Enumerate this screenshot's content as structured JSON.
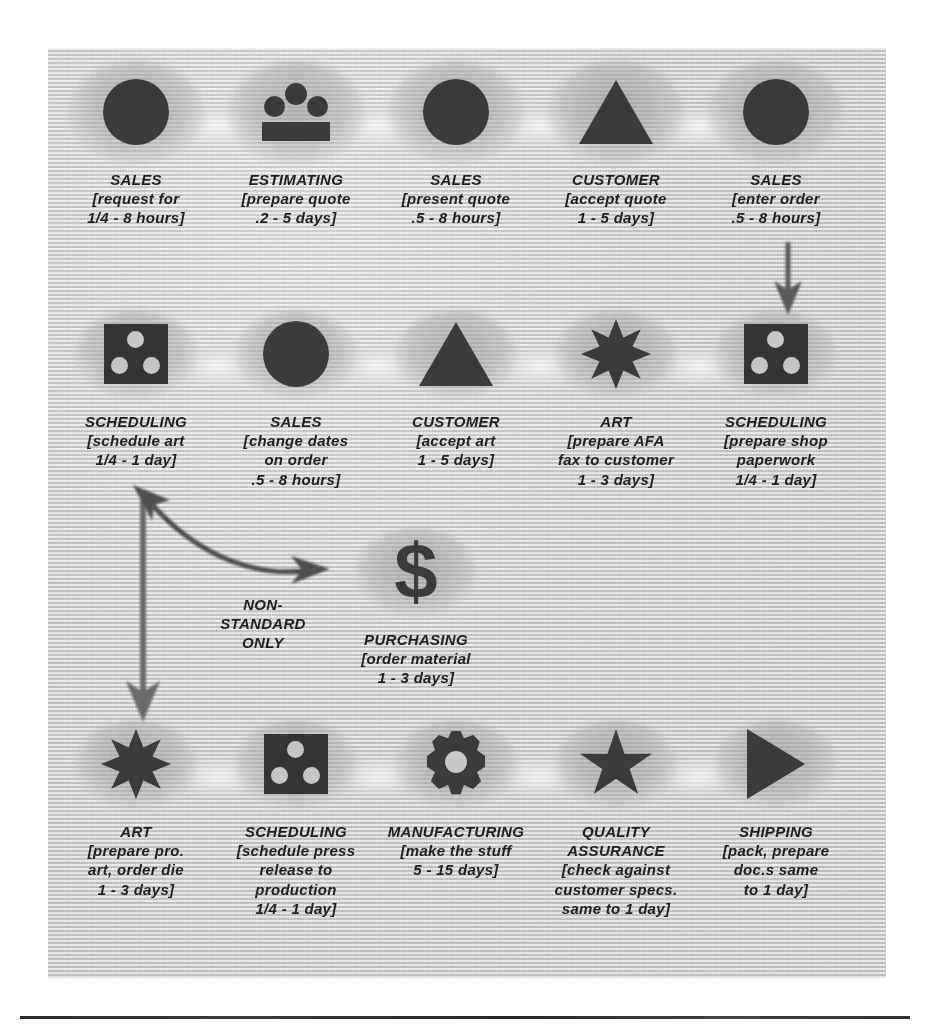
{
  "diagram": {
    "accent_color": "#3b3b3b",
    "background_color": "#d4d4d4",
    "rows": [
      {
        "row_id": "row-1",
        "nodes": [
          {
            "id": "n1",
            "icon": "circle-icon",
            "dept": "SALES",
            "detail_lines": [
              "[request for",
              "1/4 - 8 hours]"
            ]
          },
          {
            "id": "n2",
            "icon": "people-group-icon",
            "dept": "ESTIMATING",
            "detail_lines": [
              "[prepare quote",
              ".2 - 5 days]"
            ]
          },
          {
            "id": "n3",
            "icon": "circle-icon",
            "dept": "SALES",
            "detail_lines": [
              "[present quote",
              ".5 - 8 hours]"
            ]
          },
          {
            "id": "n4",
            "icon": "triangle-icon",
            "dept": "CUSTOMER",
            "detail_lines": [
              "[accept quote",
              "1 - 5 days]"
            ]
          },
          {
            "id": "n5",
            "icon": "circle-icon",
            "dept": "SALES",
            "detail_lines": [
              "[enter order",
              ".5 - 8 hours]"
            ]
          }
        ]
      },
      {
        "row_id": "row-2",
        "nodes": [
          {
            "id": "n6",
            "icon": "square-three-dots-icon",
            "dept": "SCHEDULING",
            "detail_lines": [
              "[schedule art",
              "1/4 - 1 day]"
            ]
          },
          {
            "id": "n7",
            "icon": "circle-icon",
            "dept": "SALES",
            "detail_lines": [
              "[change dates",
              "on order",
              ".5 - 8 hours]"
            ]
          },
          {
            "id": "n8",
            "icon": "triangle-icon",
            "dept": "CUSTOMER",
            "detail_lines": [
              "[accept art",
              "1 - 5 days]"
            ]
          },
          {
            "id": "n9",
            "icon": "starburst-icon",
            "dept": "ART",
            "detail_lines": [
              "[prepare AFA",
              "fax to customer",
              "1 - 3 days]"
            ]
          },
          {
            "id": "n10",
            "icon": "square-three-dots-icon",
            "dept": "SCHEDULING",
            "detail_lines": [
              "[prepare shop",
              "paperwork",
              "1/4 - 1 day]"
            ]
          }
        ]
      },
      {
        "row_id": "row-3",
        "nodes": [
          {
            "id": "n11",
            "icon": "dollar-sign-icon",
            "dept": "PURCHASING",
            "detail_lines": [
              "[order material",
              "1 - 3 days]"
            ]
          }
        ]
      },
      {
        "row_id": "row-4",
        "nodes": [
          {
            "id": "n12",
            "icon": "starburst-icon",
            "dept": "ART",
            "detail_lines": [
              "[prepare pro.",
              "art, order die",
              "1 - 3 days]"
            ]
          },
          {
            "id": "n13",
            "icon": "square-three-dots-icon",
            "dept": "SCHEDULING",
            "detail_lines": [
              "[schedule press",
              "release to",
              "production",
              "1/4 - 1 day]"
            ]
          },
          {
            "id": "n14",
            "icon": "gear-icon",
            "dept": "MANUFACTURING",
            "detail_lines": [
              "[make the stuff",
              "5 - 15 days]"
            ]
          },
          {
            "id": "n15",
            "icon": "star-icon",
            "dept": "QUALITY\nASSURANCE",
            "dept_lines": [
              "QUALITY",
              "ASSURANCE"
            ],
            "detail_lines": [
              "[check against",
              "customer specs.",
              "same to 1 day]"
            ]
          },
          {
            "id": "n16",
            "icon": "play-triangle-icon",
            "dept": "SHIPPING",
            "detail_lines": [
              "[pack, prepare",
              "doc.s same",
              "to 1 day]"
            ]
          }
        ]
      }
    ],
    "annotations": {
      "nonstandard_label_lines": [
        "NON-",
        "STANDARD",
        "ONLY"
      ]
    },
    "glyph_chars": {
      "dollar-sign-icon": "$"
    }
  }
}
